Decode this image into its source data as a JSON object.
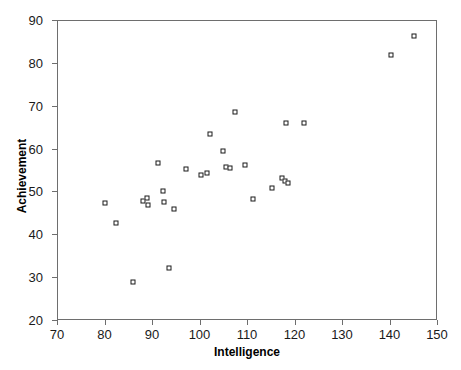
{
  "chart_data": {
    "type": "scatter",
    "title": "",
    "xlabel": "Intelligence",
    "ylabel": "Achievement",
    "xlim": [
      70,
      150
    ],
    "ylim": [
      20,
      90
    ],
    "xticks": [
      70,
      80,
      90,
      100,
      110,
      120,
      130,
      140,
      150
    ],
    "yticks": [
      20,
      30,
      40,
      50,
      60,
      70,
      80,
      90
    ],
    "grid": false,
    "legend": null,
    "marker": "open-square",
    "marker_color": "#1a1a1a",
    "frame_color": "#6e6e6e",
    "series": [
      {
        "name": "observations",
        "points": [
          [
            80.1,
            47.2
          ],
          [
            82.4,
            42.6
          ],
          [
            85.9,
            28.8
          ],
          [
            88.1,
            47.8
          ],
          [
            88.9,
            48.4
          ],
          [
            89.2,
            46.8
          ],
          [
            91.2,
            56.6
          ],
          [
            92.4,
            50.2
          ],
          [
            92.6,
            47.6
          ],
          [
            93.6,
            32.2
          ],
          [
            94.7,
            45.8
          ],
          [
            97.1,
            55.2
          ],
          [
            100.3,
            53.8
          ],
          [
            101.6,
            54.4
          ],
          [
            102.2,
            63.4
          ],
          [
            104.9,
            59.4
          ],
          [
            105.6,
            55.6
          ],
          [
            106.4,
            55.4
          ],
          [
            107.4,
            68.5
          ],
          [
            109.5,
            56.2
          ],
          [
            111.2,
            48.2
          ],
          [
            115.3,
            50.8
          ],
          [
            117.4,
            53.2
          ],
          [
            117.9,
            52.4
          ],
          [
            118.2,
            66.0
          ],
          [
            118.6,
            52.0
          ],
          [
            122.1,
            66.0
          ],
          [
            140.4,
            81.8
          ],
          [
            145.2,
            86.2
          ]
        ]
      }
    ]
  }
}
